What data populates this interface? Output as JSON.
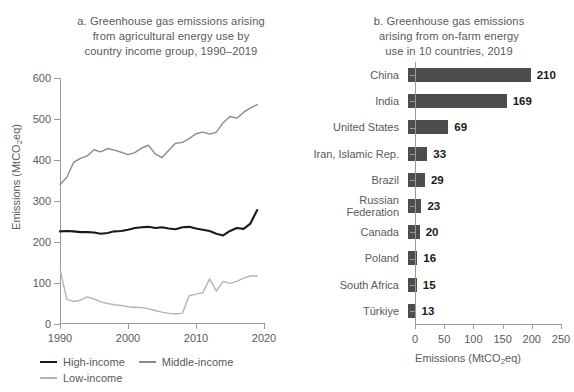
{
  "chart_data": [
    {
      "type": "line",
      "panel": "a",
      "title": "a. Greenhouse gas emissions arising from agricultural energy use by country income group, 1990–2019",
      "title_lines": [
        "a. Greenhouse gas emissions arising",
        "from agricultural energy use by",
        "country income group, 1990–2019"
      ],
      "xlabel": "",
      "ylabel": "Emissions (MtCO2eq)",
      "ylabel_prefix": "Emissions (MtCO",
      "ylabel_sub": "2",
      "ylabel_suffix": "eq)",
      "xlim": [
        1990,
        2020
      ],
      "ylim": [
        0,
        600
      ],
      "yticks": [
        0,
        100,
        200,
        300,
        400,
        500,
        600
      ],
      "xticks": [
        1990,
        2000,
        2010,
        2020
      ],
      "grid": false,
      "legend_position": "bottom-left",
      "x": [
        1990,
        1991,
        1992,
        1993,
        1994,
        1995,
        1996,
        1997,
        1998,
        1999,
        2000,
        2001,
        2002,
        2003,
        2004,
        2005,
        2006,
        2007,
        2008,
        2009,
        2010,
        2011,
        2012,
        2013,
        2014,
        2015,
        2016,
        2017,
        2018,
        2019
      ],
      "series": [
        {
          "name": "High-income",
          "color": "#1a1a1a",
          "values": [
            226,
            227,
            226,
            224,
            224,
            223,
            220,
            222,
            226,
            227,
            230,
            234,
            236,
            237,
            234,
            236,
            233,
            231,
            236,
            237,
            233,
            230,
            227,
            220,
            216,
            227,
            234,
            232,
            245,
            278
          ]
        },
        {
          "name": "Middle-income",
          "color": "#8a8a8a",
          "values": [
            340,
            358,
            394,
            404,
            410,
            425,
            420,
            428,
            424,
            419,
            413,
            418,
            429,
            436,
            415,
            406,
            424,
            441,
            443,
            452,
            464,
            468,
            463,
            468,
            491,
            506,
            502,
            516,
            527,
            535
          ]
        },
        {
          "name": "Low-income",
          "color": "#b4b4b4",
          "values": [
            134,
            60,
            55,
            58,
            66,
            61,
            54,
            50,
            47,
            45,
            42,
            41,
            40,
            37,
            33,
            29,
            26,
            25,
            26,
            69,
            73,
            76,
            110,
            80,
            104,
            99,
            104,
            112,
            117,
            117
          ]
        }
      ]
    },
    {
      "type": "bar",
      "panel": "b",
      "orientation": "horizontal",
      "title": "b. Greenhouse gas emissions arising from on-farm energy use in 10 countries, 2019",
      "title_lines": [
        "b. Greenhouse gas emissions",
        "arising from on-farm energy",
        "use in 10 countries, 2019"
      ],
      "xlabel": "Emissions (MtCO2eq)",
      "xlabel_prefix": "Emissions (MtCO",
      "xlabel_sub": "2",
      "xlabel_suffix": "eq)",
      "ylabel": "",
      "xlim": [
        0,
        250
      ],
      "xticks": [
        0,
        50,
        100,
        150,
        200,
        250
      ],
      "grid": false,
      "bar_color": "#4d4d4d",
      "categories": [
        "China",
        "India",
        "United States",
        "Iran, Islamic Rep.",
        "Brazil",
        "Russian\nFederation",
        "Canada",
        "Poland",
        "South Africa",
        "Türkiye"
      ],
      "values": [
        210,
        169,
        69,
        33,
        29,
        23,
        20,
        16,
        15,
        13
      ],
      "value_labels": [
        "210",
        "169",
        "69",
        "33",
        "29",
        "23",
        "20",
        "16",
        "15",
        "13"
      ]
    }
  ],
  "panel_a": {
    "title_l1": "a. Greenhouse gas emissions arising",
    "title_l2": "from agricultural energy use by",
    "title_l3": "country income group, 1990–2019",
    "ylabel_prefix": "Emissions (MtCO",
    "ylabel_sub": "2",
    "ylabel_suffix": "eq)",
    "legend": [
      {
        "label": "High-income",
        "color": "#1a1a1a"
      },
      {
        "label": "Middle-income",
        "color": "#8a8a8a"
      },
      {
        "label": "Low-income",
        "color": "#b4b4b4"
      }
    ]
  },
  "panel_b": {
    "title_l1": "b. Greenhouse gas emissions",
    "title_l2": "arising from on-farm energy",
    "title_l3": "use in 10 countries, 2019",
    "xlabel_prefix": "Emissions (MtCO",
    "xlabel_sub": "2",
    "xlabel_suffix": "eq)"
  }
}
